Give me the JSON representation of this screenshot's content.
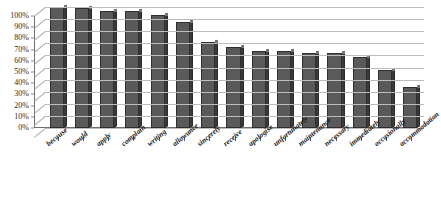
{
  "chart_data": {
    "type": "bar",
    "title": "",
    "xlabel": "",
    "ylabel": "",
    "ylim": [
      0,
      100
    ],
    "grid": true,
    "legend": "none",
    "orientation": "vertical",
    "style": "3d-column",
    "bar_color": "#5a5a5a",
    "bar_side_color": "#3a3a3a",
    "gridline_color": "#bdbdbd",
    "background_color": "#ffffff",
    "y_tick_labels": [
      "100%",
      "90%",
      "80%",
      "70%",
      "60%",
      "50%",
      "40%",
      "30%",
      "20%",
      "10%",
      "0%"
    ],
    "y_tick_values": [
      100,
      90,
      80,
      70,
      60,
      50,
      40,
      30,
      20,
      10,
      0
    ],
    "categories": [
      "because",
      "would",
      "apply",
      "complain",
      "writing",
      "allowance",
      "sincerely",
      "receive",
      "apologise",
      "unfortunately",
      "maintenance",
      "necessary",
      "immediately",
      "occasionally",
      "accommodation"
    ],
    "values": [
      100,
      99,
      97,
      97,
      93,
      88,
      71,
      67,
      64,
      64,
      62,
      62,
      59,
      48,
      34
    ]
  }
}
